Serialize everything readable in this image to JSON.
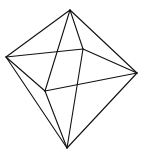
{
  "diagram": {
    "type": "wireframe-octahedron",
    "stroke_color": "#111111",
    "background": "#ffffff",
    "vertices": {
      "top": [
        70,
        10
      ],
      "left": [
        6,
        57
      ],
      "right": [
        137,
        73
      ],
      "bottom": [
        67,
        148
      ],
      "front": [
        45,
        91
      ],
      "back": [
        83,
        49
      ]
    },
    "edges": [
      [
        "top",
        "left"
      ],
      [
        "top",
        "right"
      ],
      [
        "top",
        "front"
      ],
      [
        "top",
        "back"
      ],
      [
        "left",
        "back"
      ],
      [
        "back",
        "right"
      ],
      [
        "right",
        "front"
      ],
      [
        "front",
        "left"
      ],
      [
        "bottom",
        "left"
      ],
      [
        "bottom",
        "right"
      ],
      [
        "bottom",
        "front"
      ],
      [
        "bottom",
        "back"
      ]
    ]
  }
}
